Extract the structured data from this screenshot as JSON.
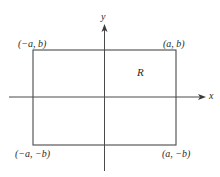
{
  "diagram": {
    "axes": {
      "x_label": "x",
      "y_label": "y"
    },
    "region_label": "R",
    "corners": {
      "top_left": "(−a, b)",
      "top_right": "(a, b)",
      "bottom_left": "(−a, −b)",
      "bottom_right": "(a, −b)"
    },
    "colors": {
      "line": "#4a4a4a",
      "text": "#2a2a2a",
      "background": "#ffffff"
    }
  }
}
